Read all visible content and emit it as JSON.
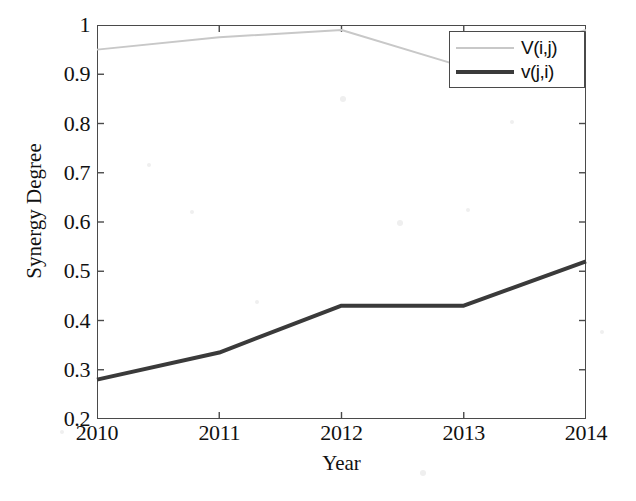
{
  "figure": {
    "background_color": "#ffffff",
    "frame_color": "#4a4a4a"
  },
  "chart_data": {
    "type": "line",
    "title": "",
    "xlabel": "Year",
    "ylabel": "Synergy Degree",
    "x": [
      2010,
      2011,
      2012,
      2013,
      2014
    ],
    "xticklabels": [
      "2010",
      "2011",
      "2012",
      "2013",
      "2014"
    ],
    "xlim": [
      2010,
      2014
    ],
    "ylim": [
      0.2,
      1.0
    ],
    "yticks": [
      0.2,
      0.3,
      0.4,
      0.5,
      0.6,
      0.7,
      0.8,
      0.9,
      1.0
    ],
    "yticklabels": [
      "0.2",
      "0.3",
      "0.4",
      "0.5",
      "0.6",
      "0.7",
      "0.8",
      "0.9",
      "1"
    ],
    "grid": false,
    "legend_position": "top-right",
    "series": [
      {
        "name": "V(i,j)",
        "color": "#c8c8c8",
        "line_width": 2,
        "values": [
          0.95,
          0.975,
          0.99,
          0.915,
          0.99
        ]
      },
      {
        "name": "v(j,i)",
        "color": "#3a3a3a",
        "line_width": 4,
        "values": [
          0.28,
          0.335,
          0.43,
          0.43,
          0.52
        ]
      }
    ]
  },
  "legend": {
    "entries": [
      {
        "label": "V(i,j)",
        "swatch": "light-thin-line"
      },
      {
        "label": "v(j,i)",
        "swatch": "dark-thick-line"
      }
    ]
  }
}
